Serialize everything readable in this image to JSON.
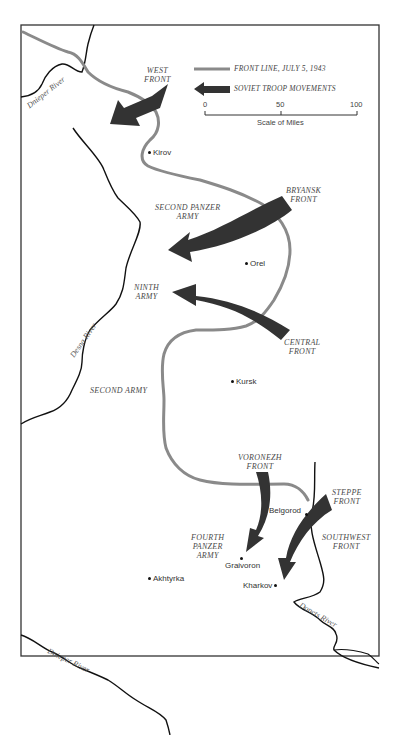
{
  "map": {
    "title": "",
    "legend": {
      "front_line": "FRONT LINE, JULY 5, 1943",
      "troop_movements": "SOVIET TROOP MOVEMENTS",
      "scale": {
        "ticks": [
          "0",
          "50",
          "100"
        ],
        "caption": "Scale of Miles"
      }
    },
    "colors": {
      "front_line": "#8a8a8a",
      "arrows": "#333333",
      "rivers": "#111111",
      "frame": "#333333"
    },
    "soviet_fronts": [
      {
        "name": "WEST\nFRONT"
      },
      {
        "name": "BRYANSK\nFRONT"
      },
      {
        "name": "CENTRAL\nFRONT"
      },
      {
        "name": "VORONEZH\nFRONT"
      },
      {
        "name": "STEPPE\nFRONT"
      },
      {
        "name": "SOUTHWEST\nFRONT"
      }
    ],
    "german_armies": [
      {
        "name": "SECOND PANZER\nARMY"
      },
      {
        "name": "NINTH\nARMY"
      },
      {
        "name": "SECOND ARMY"
      },
      {
        "name": "FOURTH\nPANZER\nARMY"
      }
    ],
    "cities": [
      {
        "name": "Kirov"
      },
      {
        "name": "Orel"
      },
      {
        "name": "Kursk"
      },
      {
        "name": "Belgorod"
      },
      {
        "name": "Graivoron"
      },
      {
        "name": "Akhtyrka"
      },
      {
        "name": "Kharkov"
      }
    ],
    "rivers": [
      {
        "name": "Dnieper River"
      },
      {
        "name": "Desna River"
      },
      {
        "name": "Donets River"
      },
      {
        "name": "Dnieper River"
      }
    ]
  }
}
